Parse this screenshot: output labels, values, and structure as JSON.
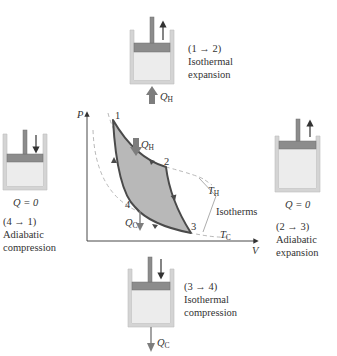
{
  "diagram": {
    "type": "Carnot cycle P-V diagram with piston-cylinder stages",
    "axes": {
      "y_label": "P",
      "x_label": "V"
    },
    "points": [
      {
        "id": "1",
        "label": "1"
      },
      {
        "id": "2",
        "label": "2"
      },
      {
        "id": "3",
        "label": "3"
      },
      {
        "id": "4",
        "label": "4"
      }
    ],
    "isotherms": {
      "hot": "T",
      "hot_sub": "H",
      "cold": "T",
      "cold_sub": "C",
      "bracket_label": "Isotherms"
    },
    "graph_heat": {
      "in": {
        "symbol": "Q",
        "sub": "H"
      },
      "out": {
        "symbol": "Q",
        "sub": "C"
      }
    },
    "stages": {
      "top": {
        "step": "(1 → 2)",
        "line1": "Isothermal",
        "line2": "expansion",
        "heat_symbol": "Q",
        "heat_sub": "H",
        "piston_motion": "up"
      },
      "right": {
        "step": "(2 → 3)",
        "line1": "Adiabatic",
        "line2": "expansion",
        "heat": "Q = 0",
        "piston_motion": "up"
      },
      "bottom": {
        "step": "(3 → 4)",
        "line1": "Isothermal",
        "line2": "compression",
        "heat_symbol": "Q",
        "heat_sub": "C",
        "piston_motion": "down"
      },
      "left": {
        "step": "(4 → 1)",
        "line1": "Adiabatic",
        "line2": "compression",
        "heat": "Q = 0",
        "piston_motion": "down"
      }
    },
    "colors": {
      "cycle_fill": "#b8b8b8",
      "cycle_stroke": "#4a4a4a",
      "isotherm_dash": "#b0b0b0",
      "cylinder_wall": "#d4d4d4",
      "gas_fill": "#ececec",
      "piston": "#8c8c8c",
      "heat_arrow": "#7d7d7d"
    }
  }
}
